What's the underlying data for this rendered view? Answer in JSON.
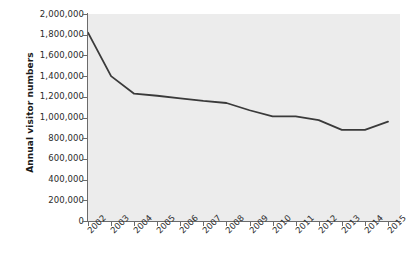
{
  "chart_data": {
    "type": "line",
    "title": "",
    "xlabel": "",
    "ylabel": "Annual visitor numbers",
    "categories": [
      "2002",
      "2003",
      "2004",
      "2005",
      "2006",
      "2007",
      "2008",
      "2009",
      "2010",
      "2011",
      "2012",
      "2013",
      "2014",
      "2015"
    ],
    "values": [
      1820000,
      1400000,
      1230000,
      1210000,
      1185000,
      1160000,
      1140000,
      1070000,
      1010000,
      1010000,
      975000,
      880000,
      880000,
      960000
    ],
    "series": [
      {
        "name": "Annual visitor numbers",
        "values": [
          1820000,
          1400000,
          1230000,
          1210000,
          1185000,
          1160000,
          1140000,
          1070000,
          1010000,
          1010000,
          975000,
          880000,
          880000,
          960000
        ]
      }
    ],
    "ylim": [
      0,
      2000000
    ],
    "y_ticks": [
      0,
      200000,
      400000,
      600000,
      800000,
      1000000,
      1200000,
      1400000,
      1600000,
      1800000,
      2000000
    ],
    "y_tick_labels": [
      "0",
      "200,000",
      "400,000",
      "600,000",
      "800,000",
      "1,000,000",
      "1,200,000",
      "1,400,000",
      "1,600,000",
      "1,800,000",
      "2,000,000"
    ],
    "grid": false,
    "legend": false,
    "legend_position": "none",
    "line_color": "#3a3a3a",
    "plot_background_color": "#ececec",
    "axis_color": "#6b6b6b",
    "text_color": "#2b2b2b"
  }
}
